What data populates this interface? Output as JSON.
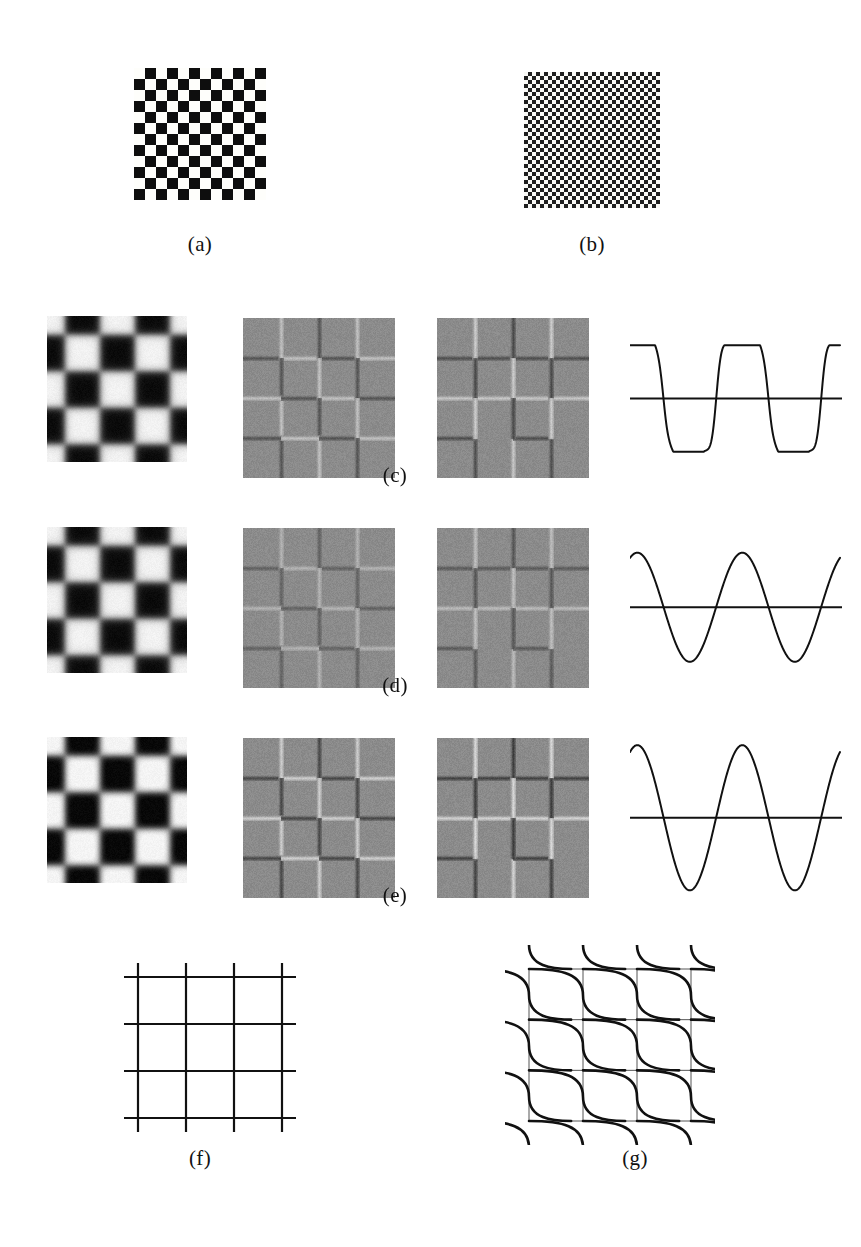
{
  "figure": {
    "background_color": "#ffffff",
    "ink_color": "#111111",
    "gray_mid": "#8b8b8b",
    "gray_light": "#f0f0ee",
    "gray_dark": "#2e2e2e"
  },
  "captions": {
    "a": "(a)",
    "b": "(b)",
    "c": "(c)",
    "d": "(d)",
    "e": "(e)",
    "f": "(f)",
    "g": "(g)"
  },
  "panels": {
    "a": {
      "label": "(a)",
      "kind": "checkerboard",
      "description": "coarse high-contrast checkerboard",
      "cells_x": 12,
      "cells_y": 12,
      "cell_px": 11,
      "dark_color": "#161616",
      "light_color": "#f5f5f2"
    },
    "b": {
      "label": "(b)",
      "kind": "checkerboard",
      "description": "fine high-contrast checkerboard, higher spatial frequency",
      "cells_x": 34,
      "cells_y": 34,
      "cell_px": 4,
      "dark_color": "#262626",
      "light_color": "#f1f1ee"
    },
    "c": {
      "label": "(c)",
      "blurred_checker": {
        "cells": 4,
        "blur_px": 7,
        "contrast": 1.0,
        "description": "lightly blurred checkerboard, square corners still visible"
      },
      "edge_grid_1": {
        "description": "gray field with light and dark borders, orthogonal edge response",
        "edge_strength": 0.55,
        "variant": "orthogonal"
      },
      "edge_grid_2": {
        "description": "gray field with staircase / diagonal edge response",
        "edge_strength": 0.62,
        "variant": "staircase"
      },
      "waveform": {
        "shape": "clipped-square",
        "cycles": 2,
        "amplitude": 1.0,
        "clip": 0.86,
        "description": "near square wave with flattened peaks and slight ripple"
      }
    },
    "d": {
      "label": "(d)",
      "blurred_checker": {
        "cells": 4,
        "blur_px": 12,
        "contrast": 1.0,
        "description": "more blurred checkerboard, rounded blobs"
      },
      "edge_grid_1": {
        "description": "gray field, weaker orthogonal edge response",
        "edge_strength": 0.42,
        "variant": "orthogonal"
      },
      "edge_grid_2": {
        "description": "gray field, staircase edge response",
        "edge_strength": 0.5,
        "variant": "staircase"
      },
      "waveform": {
        "shape": "sinusoid",
        "cycles": 2,
        "amplitude": 0.92,
        "clip": 1.0,
        "description": "pure sine wave, moderate amplitude"
      }
    },
    "e": {
      "label": "(e)",
      "blurred_checker": {
        "cells": 4,
        "blur_px": 15,
        "contrast": 1.1,
        "description": "heavily blurred checkerboard, round dark blobs"
      },
      "edge_grid_1": {
        "description": "gray field, strong orthogonal edge response",
        "edge_strength": 0.7,
        "variant": "orthogonal"
      },
      "edge_grid_2": {
        "description": "gray field, strong staircase edge response",
        "edge_strength": 0.75,
        "variant": "staircase"
      },
      "waveform": {
        "shape": "sinusoid",
        "cycles": 2,
        "amplitude": 1.15,
        "clip": 1.0,
        "description": "sine wave of larger amplitude"
      }
    },
    "f": {
      "label": "(f)",
      "kind": "line-grid",
      "description": "plain square grid of straight lines",
      "vertical_lines": 4,
      "horizontal_lines": 4,
      "overhang_px": 14,
      "stroke_px": 2.2
    },
    "g": {
      "label": "(g)",
      "kind": "distorted-grid",
      "description": "thin square grid overlaid with thick S-shaped (sigmoid) curves producing apparent distortion",
      "vertical_lines": 4,
      "horizontal_lines": 4,
      "thin_stroke_px": 1,
      "curve_stroke_px": 2.6,
      "curve_rows": 4,
      "curve_cols": 4
    }
  }
}
